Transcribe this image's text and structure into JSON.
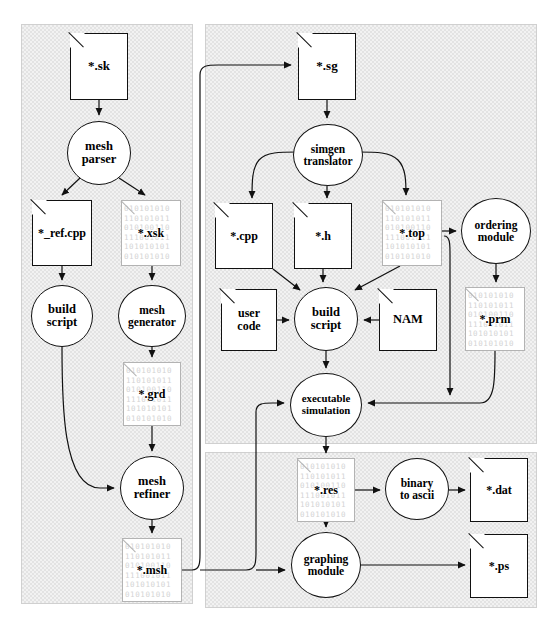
{
  "diagram": {
    "bit_pattern": "010101010\n110101011\n010100110\n111001011\n101010101\n010101010",
    "panels": [
      {
        "name": "mesh-generation-panel",
        "x": 21,
        "y": 24,
        "w": 172,
        "h": 580
      },
      {
        "name": "code-generation-panel",
        "x": 205,
        "y": 24,
        "w": 332,
        "h": 420
      },
      {
        "name": "postprocessing-panel",
        "x": 205,
        "y": 452,
        "w": 332,
        "h": 156
      }
    ],
    "nodes": [
      {
        "id": "sk",
        "name": "file-sk",
        "kind": "file",
        "binary": false,
        "label": "*.sk",
        "x": 70,
        "y": 33,
        "w": 58,
        "h": 67,
        "font": 13
      },
      {
        "id": "meshparser",
        "name": "process-mesh-parser",
        "kind": "proc",
        "label1": "mesh",
        "label2": "parser",
        "x": 67,
        "y": 121,
        "w": 64,
        "h": 64,
        "font": 12.5
      },
      {
        "id": "refcpp",
        "name": "file-ref-cpp",
        "kind": "file",
        "binary": false,
        "label": "*_ref.cpp",
        "x": 32,
        "y": 200,
        "w": 60,
        "h": 66,
        "font": 12
      },
      {
        "id": "xsk",
        "name": "file-xsk",
        "kind": "file",
        "binary": true,
        "label": "*.xsk",
        "x": 121,
        "y": 200,
        "w": 60,
        "h": 66,
        "font": 12
      },
      {
        "id": "buildscript1",
        "name": "process-build-script-mesh",
        "kind": "proc",
        "label1": "build",
        "label2": "script",
        "x": 31,
        "y": 285,
        "w": 62,
        "h": 62,
        "font": 12.5
      },
      {
        "id": "meshgen",
        "name": "process-mesh-generator",
        "kind": "proc",
        "label1": "mesh",
        "label2": "generator",
        "x": 118,
        "y": 285,
        "w": 68,
        "h": 62,
        "font": 11.5
      },
      {
        "id": "grd",
        "name": "file-grd",
        "kind": "file",
        "binary": true,
        "label": "*.grd",
        "x": 123,
        "y": 362,
        "w": 58,
        "h": 64,
        "font": 12
      },
      {
        "id": "meshref",
        "name": "process-mesh-refiner",
        "kind": "proc",
        "label1": "mesh",
        "label2": "refiner",
        "x": 120,
        "y": 456,
        "w": 64,
        "h": 64,
        "font": 12.5
      },
      {
        "id": "msh",
        "name": "file-msh",
        "kind": "file",
        "binary": true,
        "label": "*.msh",
        "x": 122,
        "y": 538,
        "w": 60,
        "h": 64,
        "font": 12
      },
      {
        "id": "sg",
        "name": "file-sg",
        "kind": "file",
        "binary": false,
        "label": "*.sg",
        "x": 298,
        "y": 33,
        "w": 58,
        "h": 67,
        "font": 13
      },
      {
        "id": "simgen",
        "name": "process-simgen-translator",
        "kind": "proc",
        "label1": "simgen",
        "label2": "translator",
        "x": 293,
        "y": 124,
        "w": 70,
        "h": 62,
        "font": 11.5
      },
      {
        "id": "cpp",
        "name": "file-cpp",
        "kind": "file",
        "binary": false,
        "label": "*.cpp",
        "x": 215,
        "y": 203,
        "w": 58,
        "h": 66,
        "font": 12
      },
      {
        "id": "h",
        "name": "file-h",
        "kind": "file",
        "binary": false,
        "label": "*.h",
        "x": 294,
        "y": 203,
        "w": 58,
        "h": 66,
        "font": 12
      },
      {
        "id": "top",
        "name": "file-top",
        "kind": "file",
        "binary": true,
        "label": "*.top",
        "x": 382,
        "y": 200,
        "w": 60,
        "h": 66,
        "font": 12
      },
      {
        "id": "ordering",
        "name": "process-ordering-module",
        "kind": "proc",
        "label1": "ordering",
        "label2": "module",
        "x": 461,
        "y": 198,
        "w": 70,
        "h": 66,
        "font": 11.5
      },
      {
        "id": "usercode",
        "name": "file-user-code",
        "kind": "file",
        "binary": false,
        "label1": "user",
        "label2": "code",
        "x": 221,
        "y": 289,
        "w": 56,
        "h": 62,
        "font": 12
      },
      {
        "id": "buildscript2",
        "name": "process-build-script-sim",
        "kind": "proc",
        "label1": "build",
        "label2": "script",
        "x": 294,
        "y": 287,
        "w": 64,
        "h": 64,
        "font": 12.5
      },
      {
        "id": "nam",
        "name": "file-nam",
        "kind": "file",
        "binary": false,
        "label": "NAM",
        "x": 379,
        "y": 289,
        "w": 58,
        "h": 62,
        "font": 12.5
      },
      {
        "id": "prm",
        "name": "file-prm",
        "kind": "file",
        "binary": true,
        "label": "*.prm",
        "x": 465,
        "y": 287,
        "w": 60,
        "h": 64,
        "font": 12
      },
      {
        "id": "execsim",
        "name": "process-executable-simulation",
        "kind": "proc",
        "label1": "executable",
        "label2": "simulation",
        "x": 290,
        "y": 373,
        "w": 72,
        "h": 64,
        "font": 10.8
      },
      {
        "id": "res",
        "name": "file-res",
        "kind": "file",
        "binary": true,
        "label": "*.res",
        "x": 297,
        "y": 458,
        "w": 58,
        "h": 64,
        "font": 12
      },
      {
        "id": "bin2ascii",
        "name": "process-binary-to-ascii",
        "kind": "proc",
        "label1": "binary",
        "label2": "to ascii",
        "x": 385,
        "y": 458,
        "w": 64,
        "h": 62,
        "font": 11.5
      },
      {
        "id": "dat",
        "name": "file-dat",
        "kind": "file",
        "binary": false,
        "label": "*.dat",
        "x": 470,
        "y": 458,
        "w": 58,
        "h": 64,
        "font": 12
      },
      {
        "id": "graphing",
        "name": "process-graphing-module",
        "kind": "proc",
        "label1": "graphing",
        "label2": "module",
        "x": 291,
        "y": 532,
        "w": 70,
        "h": 66,
        "font": 11.5
      },
      {
        "id": "ps",
        "name": "file-ps",
        "kind": "file",
        "binary": false,
        "label": "*.ps",
        "x": 470,
        "y": 534,
        "w": 58,
        "h": 64,
        "font": 12
      }
    ],
    "edges": [
      {
        "name": "edge-sk-to-mesh-parser",
        "d": "M 99,100 L 99,115"
      },
      {
        "name": "edge-mesh-parser-to-ref-cpp",
        "d": "M 80,178 L 62,195"
      },
      {
        "name": "edge-mesh-parser-to-xsk",
        "d": "M 119,178 L 145,195"
      },
      {
        "name": "edge-ref-cpp-to-build-script",
        "d": "M 62,266 L 62,280"
      },
      {
        "name": "edge-xsk-to-mesh-generator",
        "d": "M 152,266 L 152,280"
      },
      {
        "name": "edge-build-script-to-mesh-refiner",
        "d": "M 62,347 C 62,400 62,488 100,488 L 114,488"
      },
      {
        "name": "edge-mesh-generator-to-grd",
        "d": "M 152,347 L 152,357"
      },
      {
        "name": "edge-grd-to-mesh-refiner",
        "d": "M 152,426 L 152,451"
      },
      {
        "name": "edge-mesh-refiner-to-msh",
        "d": "M 152,520 L 152,533"
      },
      {
        "name": "edge-msh-to-sg",
        "d": "M 182,570 L 192,570 C 200,570 200,562 200,554 L 200,75 C 200,65 208,65 218,65 L 291,65"
      },
      {
        "name": "edge-msh-to-exec-sim",
        "d": "M 200,570 L 246,570 C 256,570 256,562 256,552 L 256,412 C 256,403 264,403 272,403 L 284,403"
      },
      {
        "name": "edge-msh-to-graphing",
        "d": "M 256,570 L 285,570"
      },
      {
        "name": "edge-sg-to-simgen",
        "d": "M 327,100 L 327,118"
      },
      {
        "name": "edge-simgen-to-cpp",
        "d": "M 298,152 C 280,152 266,152 259,160 C 252,168 252,182 252,198"
      },
      {
        "name": "edge-simgen-to-h",
        "d": "M 327,186 L 327,198"
      },
      {
        "name": "edge-simgen-to-top",
        "d": "M 358,152 C 376,152 390,152 398,160 C 406,168 406,182 406,195"
      },
      {
        "name": "edge-top-to-ordering",
        "d": "M 442,231 L 456,231"
      },
      {
        "name": "edge-ordering-to-prm",
        "d": "M 496,264 L 496,282"
      },
      {
        "name": "edge-cpp-to-build-script",
        "d": "M 273,269 L 300,290"
      },
      {
        "name": "edge-h-to-build-script",
        "d": "M 323,269 L 323,282"
      },
      {
        "name": "edge-top-to-build-script",
        "d": "M 400,266 L 355,290"
      },
      {
        "name": "edge-user-code-to-build-script",
        "d": "M 277,320 L 289,320"
      },
      {
        "name": "edge-nam-to-build-script",
        "d": "M 379,320 L 364,320"
      },
      {
        "name": "edge-build-script-to-exec-sim",
        "d": "M 326,351 L 326,368"
      },
      {
        "name": "edge-top-to-exec-sim",
        "d": "M 444,236 C 450,236 450,244 450,254 L 450,395"
      },
      {
        "name": "edge-prm-to-exec-sim",
        "d": "M 495,351 C 495,380 495,403 480,403 L 368,403"
      },
      {
        "name": "edge-exec-sim-to-res",
        "d": "M 326,437 L 326,453"
      },
      {
        "name": "edge-res-to-binary-to-ascii",
        "d": "M 355,490 L 380,490"
      },
      {
        "name": "edge-binary-to-ascii-to-dat",
        "d": "M 449,490 L 465,490"
      },
      {
        "name": "edge-res-to-graphing",
        "d": "M 326,522 L 326,527"
      },
      {
        "name": "edge-graphing-to-ps",
        "d": "M 361,565 L 465,565"
      }
    ]
  }
}
